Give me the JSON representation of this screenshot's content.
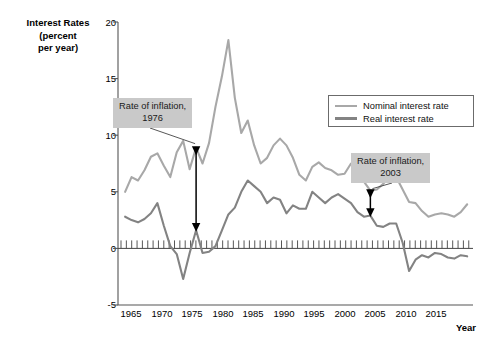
{
  "chart_data": {
    "type": "line",
    "title": "",
    "ylabel": "Interest Rates (percent per year)",
    "ylabel_lines": [
      "Interest Rates",
      "(percent",
      "per year)"
    ],
    "xlabel": "Year",
    "xlim": [
      1963,
      2018
    ],
    "ylim": [
      -5,
      20
    ],
    "yticks": [
      20,
      15,
      10,
      5,
      0,
      -5
    ],
    "ytick_labels": [
      "20",
      "15",
      "10",
      "5",
      "0",
      "-5"
    ],
    "xticks": [
      1965,
      1970,
      1975,
      1980,
      1985,
      1990,
      1995,
      2000,
      2005,
      2010,
      2015
    ],
    "xtick_labels": [
      "1965",
      "1970",
      "1975",
      "1980",
      "1985",
      "1990",
      "1995",
      "2000",
      "2005",
      "2010",
      "2015"
    ],
    "grid": false,
    "legend_position": "upper-right",
    "zero_line": true,
    "colors": {
      "nominal": "#a8a8a8",
      "real": "#838383",
      "axis": "#555555",
      "annotation_bg": "#c9c9c9",
      "arrow": "#000000"
    },
    "series": [
      {
        "name": "Nominal interest rate",
        "color": "#a8a8a8",
        "x": [
          1965,
          1966,
          1967,
          1968,
          1969,
          1970,
          1971,
          1972,
          1973,
          1974,
          1975,
          1976,
          1977,
          1978,
          1979,
          1980,
          1981,
          1982,
          1983,
          1984,
          1985,
          1986,
          1987,
          1988,
          1989,
          1990,
          1991,
          1992,
          1993,
          1994,
          1995,
          1996,
          1997,
          1998,
          1999,
          2000,
          2001,
          2002,
          2003,
          2004,
          2005,
          2006,
          2007,
          2008,
          2009,
          2010,
          2011,
          2012,
          2013,
          2014,
          2015,
          2016,
          2017,
          2018
        ],
        "values": [
          5.0,
          6.3,
          6.0,
          6.9,
          8.1,
          8.4,
          7.3,
          6.3,
          8.5,
          9.5,
          7.0,
          8.9,
          7.5,
          9.3,
          12.5,
          15.2,
          18.4,
          13.3,
          10.2,
          11.3,
          9.1,
          7.5,
          8.0,
          9.1,
          9.7,
          9.1,
          8.0,
          6.5,
          6.0,
          7.2,
          7.6,
          7.1,
          6.9,
          6.5,
          6.6,
          7.5,
          6.8,
          5.9,
          5.1,
          5.2,
          5.7,
          6.4,
          6.3,
          5.2,
          4.1,
          4.0,
          3.3,
          2.8,
          3.0,
          3.1,
          3.0,
          2.8,
          3.2,
          3.9
        ]
      },
      {
        "name": "Real interest rate",
        "color": "#838383",
        "x": [
          1965,
          1966,
          1967,
          1968,
          1969,
          1970,
          1971,
          1972,
          1973,
          1974,
          1975,
          1976,
          1977,
          1978,
          1979,
          1980,
          1981,
          1982,
          1983,
          1984,
          1985,
          1986,
          1987,
          1988,
          1989,
          1990,
          1991,
          1992,
          1993,
          1994,
          1995,
          1996,
          1997,
          1998,
          1999,
          2000,
          2001,
          2002,
          2003,
          2004,
          2005,
          2006,
          2007,
          2008,
          2009,
          2010,
          2011,
          2012,
          2013,
          2014,
          2015,
          2016,
          2017,
          2018
        ],
        "values": [
          2.8,
          2.5,
          2.3,
          2.6,
          3.1,
          4.0,
          2.0,
          0.2,
          -0.5,
          -2.7,
          -0.4,
          1.6,
          -0.4,
          -0.3,
          0.2,
          1.6,
          3.0,
          3.6,
          5.0,
          6.0,
          5.5,
          5.0,
          4.0,
          4.5,
          4.3,
          3.1,
          3.8,
          3.5,
          3.5,
          5.0,
          4.5,
          4.0,
          4.5,
          4.8,
          4.4,
          4.0,
          3.2,
          2.8,
          2.9,
          2.0,
          1.9,
          2.2,
          2.2,
          0.5,
          -2.0,
          -1.0,
          -0.6,
          -0.8,
          -0.4,
          -0.5,
          -0.8,
          -0.9,
          -0.6,
          -0.7
        ]
      }
    ],
    "annotations": [
      {
        "name": "rate-of-inflation-1976",
        "lines": [
          "Rate of inflation,",
          "1976"
        ],
        "text": "Rate of inflation, 1976",
        "year": 1976,
        "arrow": "double-headed-vertical"
      },
      {
        "name": "rate-of-inflation-2003",
        "lines": [
          "Rate of inflation,",
          "2003"
        ],
        "text": "Rate of inflation, 2003",
        "year": 2003,
        "arrow": "double-headed-vertical"
      }
    ],
    "legend": [
      {
        "label": "Nominal interest rate",
        "color": "#a8a8a8"
      },
      {
        "label": "Real interest rate",
        "color": "#838383"
      }
    ]
  }
}
